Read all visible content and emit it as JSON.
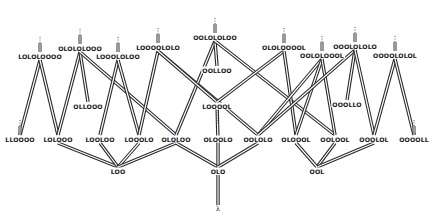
{
  "diagram": {
    "type": "lattice-tree",
    "root": {
      "id": "lambda",
      "label": "λ",
      "x": 218,
      "y": 209
    },
    "nodes": [
      {
        "id": "n0",
        "label": "LOLOLOOOO",
        "x": 40,
        "y": 56,
        "stub": true
      },
      {
        "id": "n1",
        "label": "OLOLOLOOO",
        "x": 80,
        "y": 48,
        "stub": true
      },
      {
        "id": "n2",
        "label": "LOOOLOLOO",
        "x": 118,
        "y": 56,
        "stub": true
      },
      {
        "id": "n3",
        "label": "LOOOOLOLO",
        "x": 158,
        "y": 47,
        "stub": true
      },
      {
        "id": "n4",
        "label": "OOLOLOLOO",
        "x": 215,
        "y": 37,
        "stub": true
      },
      {
        "id": "n5",
        "label": "OLOLOOOOL",
        "x": 284,
        "y": 47,
        "stub": true
      },
      {
        "id": "n6",
        "label": "OOLOLOOOL",
        "x": 322,
        "y": 55,
        "stub": true
      },
      {
        "id": "n7",
        "label": "OOOLOLOLO",
        "x": 355,
        "y": 46,
        "stub": true
      },
      {
        "id": "n8",
        "label": "OOOOLOLOL",
        "x": 395,
        "y": 55,
        "stub": true
      },
      {
        "id": "m0",
        "label": "OLLOOO",
        "x": 88,
        "y": 106
      },
      {
        "id": "m1",
        "label": "OOLLOO",
        "x": 217,
        "y": 70
      },
      {
        "id": "m2",
        "label": "LOOOOL",
        "x": 217,
        "y": 106
      },
      {
        "id": "m3",
        "label": "OOOLLO",
        "x": 347,
        "y": 104
      },
      {
        "id": "b0",
        "label": "LLOOOO",
        "x": 20,
        "y": 139,
        "stub": true
      },
      {
        "id": "b1",
        "label": "LOLOOO",
        "x": 58,
        "y": 139
      },
      {
        "id": "b2",
        "label": "LOOLOO",
        "x": 100,
        "y": 139
      },
      {
        "id": "b3",
        "label": "LOOOLO",
        "x": 139,
        "y": 139
      },
      {
        "id": "b4",
        "label": "OLOLOO",
        "x": 176,
        "y": 139
      },
      {
        "id": "b5",
        "label": "OLOOLO",
        "x": 218,
        "y": 139
      },
      {
        "id": "b6",
        "label": "OOLOLO",
        "x": 258,
        "y": 139
      },
      {
        "id": "b7",
        "label": "OLOOOL",
        "x": 296,
        "y": 139
      },
      {
        "id": "b8",
        "label": "OOLOOL",
        "x": 335,
        "y": 139
      },
      {
        "id": "b9",
        "label": "OOOLOL",
        "x": 374,
        "y": 139
      },
      {
        "id": "b10",
        "label": "OOOOLL",
        "x": 414,
        "y": 139,
        "stub": true
      },
      {
        "id": "r0",
        "label": "LOO",
        "x": 118,
        "y": 171
      },
      {
        "id": "r1",
        "label": "OLO",
        "x": 218,
        "y": 171
      },
      {
        "id": "r2",
        "label": "OOL",
        "x": 317,
        "y": 171
      }
    ],
    "edges": [
      [
        "b0",
        "n0"
      ],
      [
        "b1",
        "n0"
      ],
      [
        "b1",
        "n1"
      ],
      [
        "m0",
        "n1"
      ],
      [
        "b4",
        "n1"
      ],
      [
        "b2",
        "n2"
      ],
      [
        "b3",
        "n2"
      ],
      [
        "b3",
        "n3"
      ],
      [
        "b6",
        "n3"
      ],
      [
        "b4",
        "n4"
      ],
      [
        "m1",
        "n4"
      ],
      [
        "b8",
        "n4"
      ],
      [
        "m2",
        "n3"
      ],
      [
        "m2",
        "n5"
      ],
      [
        "b7",
        "n5"
      ],
      [
        "b6",
        "n6"
      ],
      [
        "b7",
        "n6"
      ],
      [
        "b8",
        "n6"
      ],
      [
        "b6",
        "n7"
      ],
      [
        "m3",
        "n7"
      ],
      [
        "b9",
        "n7"
      ],
      [
        "b9",
        "n8"
      ],
      [
        "b10",
        "n8"
      ],
      [
        "m2",
        "b5"
      ],
      [
        "r0",
        "b1"
      ],
      [
        "r0",
        "b2"
      ],
      [
        "r0",
        "b3"
      ],
      [
        "r0",
        "b4"
      ],
      [
        "r1",
        "b4"
      ],
      [
        "r1",
        "b5"
      ],
      [
        "r1",
        "b6"
      ],
      [
        "r2",
        "b7"
      ],
      [
        "r2",
        "b8"
      ],
      [
        "r2",
        "b9"
      ],
      [
        "r2",
        "b7"
      ],
      [
        "lambda",
        "r1"
      ]
    ]
  }
}
